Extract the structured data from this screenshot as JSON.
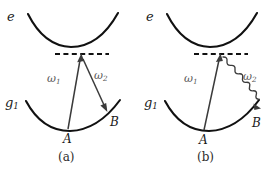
{
  "figure": {
    "width": 278,
    "height": 174,
    "background": "#ffffff",
    "curve_color": "#111111",
    "arrow_color": "#3b3b3b",
    "dashed_color": "#111111",
    "label_color": "#1a1a1a",
    "omega_color": "#5a5a5a"
  },
  "panels": [
    {
      "id": "a",
      "caption": "(a)",
      "excited_state_label": "e",
      "ground_state_label": "g",
      "ground_state_sub": "1",
      "virtual_level": "dashed-line",
      "points": [
        {
          "name": "A",
          "label": "A"
        },
        {
          "name": "B",
          "label": "B"
        }
      ],
      "transitions": [
        {
          "name": "omega1",
          "label": "ω",
          "sub": "1",
          "style": "straight-arrow",
          "direction": "up",
          "from": "A",
          "to": "virtual-level"
        },
        {
          "name": "omega2",
          "label": "ω",
          "sub": "2",
          "style": "straight-arrow",
          "direction": "down",
          "from": "virtual-level",
          "to": "B"
        }
      ]
    },
    {
      "id": "b",
      "caption": "(b)",
      "excited_state_label": "e",
      "ground_state_label": "g",
      "ground_state_sub": "1",
      "virtual_level": "dashed-line",
      "points": [
        {
          "name": "A",
          "label": "A"
        },
        {
          "name": "B",
          "label": "B"
        }
      ],
      "transitions": [
        {
          "name": "omega1",
          "label": "ω",
          "sub": "1",
          "style": "straight-arrow",
          "direction": "up",
          "from": "A",
          "to": "virtual-level"
        },
        {
          "name": "omega2",
          "label": "ω",
          "sub": "2",
          "style": "wavy-arrow",
          "direction": "down",
          "from": "virtual-level",
          "to": "B"
        }
      ]
    }
  ]
}
